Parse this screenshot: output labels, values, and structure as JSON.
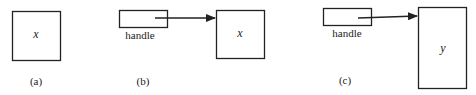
{
  "panels": [
    {
      "id": "a",
      "caption": "(a)",
      "object_label": "x"
    },
    {
      "id": "b",
      "caption": "(b)",
      "handle_label": "handle",
      "object_label": "x"
    },
    {
      "id": "c",
      "caption": "(c)",
      "handle_label": "handle",
      "object_label": "y"
    }
  ],
  "colors": {
    "stroke": "#222222",
    "background": "#ffffff"
  }
}
